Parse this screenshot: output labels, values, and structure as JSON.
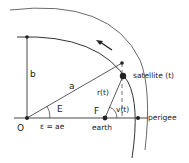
{
  "diagram": {
    "labels": {
      "b": "b",
      "a": "a",
      "E": "E",
      "O": "O",
      "eps": "ε = ae",
      "F": "F",
      "earth": "earth",
      "r": "r(t)",
      "nu": "v(t)",
      "satellite": "satellite (t)",
      "perigee": "perigee"
    },
    "points": {
      "O": [
        27,
        118
      ],
      "b_top": [
        27,
        37
      ],
      "circle_point": [
        122,
        63
      ],
      "satellite": [
        123,
        76
      ],
      "earth": [
        105,
        118
      ],
      "perigee": [
        138,
        118
      ]
    },
    "colors": {
      "line": "#333333",
      "text": "#222222"
    }
  }
}
